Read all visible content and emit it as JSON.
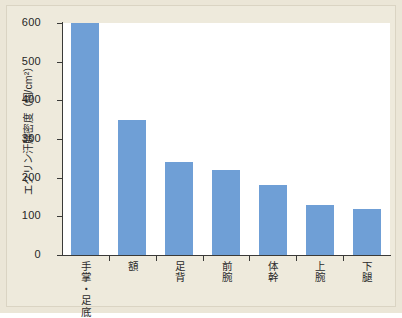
{
  "chart_data": {
    "type": "bar",
    "title": "",
    "subtitle": "",
    "xlabel": "",
    "ylabel": "エクリン汗腺密度（個/cm²）",
    "categories": [
      "手掌・足底",
      "額",
      "足背",
      "前腕",
      "体幹",
      "上腕",
      "下腿"
    ],
    "values": [
      600,
      350,
      240,
      220,
      180,
      130,
      120
    ],
    "series": [
      {
        "name": "エクリン汗腺密度",
        "values": [
          600,
          350,
          240,
          220,
          180,
          130,
          120
        ]
      }
    ],
    "ylim": [
      0,
      600
    ],
    "ytick_labels": [
      "0",
      "100",
      "200",
      "300",
      "400",
      "500",
      "600"
    ],
    "ytick_values": [
      0,
      100,
      200,
      300,
      400,
      500,
      600
    ],
    "grid": false,
    "legend": false,
    "legend_position": "none",
    "annotations": [],
    "colors": {
      "bar": "#6f9fd6",
      "axis": "#3a3a38",
      "plot_background": "#ffffff",
      "page_background": "#eeeadc",
      "frame": "#ebe6d7",
      "text": "#2b2b2b"
    }
  }
}
